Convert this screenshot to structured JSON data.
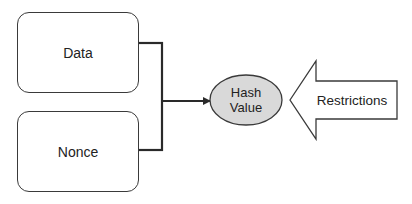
{
  "diagram": {
    "type": "flow",
    "nodes": {
      "data_box": {
        "label": "Data",
        "shape": "rounded-rectangle"
      },
      "nonce_box": {
        "label": "Nonce",
        "shape": "rounded-rectangle"
      },
      "hash_value": {
        "label_line1": "Hash",
        "label_line2": "Value",
        "shape": "ellipse",
        "fill": "#d9d9d9"
      },
      "restrictions": {
        "label": "Restrictions",
        "shape": "left-pointing-block-arrow"
      }
    },
    "edges": [
      {
        "from": "data_box",
        "to": "hash_value",
        "style": "bracket-merge"
      },
      {
        "from": "nonce_box",
        "to": "hash_value",
        "style": "bracket-merge"
      },
      {
        "from": "restrictions",
        "to": "hash_value",
        "style": "block-arrow"
      }
    ],
    "colors": {
      "stroke": "#3a3a3a",
      "ellipse_fill": "#d9d9d9",
      "background": "#ffffff",
      "text": "#222222"
    }
  }
}
